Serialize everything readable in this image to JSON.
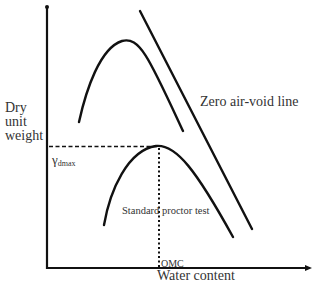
{
  "diagram": {
    "y_axis_label": [
      "Dry",
      "unit",
      "weight"
    ],
    "x_axis_label": "Water content",
    "y_marker": {
      "symbol": "γ",
      "subscript": "dmax"
    },
    "x_marker": "OMC",
    "curves": [
      {
        "name": "upper-compaction-curve",
        "label": ""
      },
      {
        "name": "standard-proctor-curve",
        "label": "Standard proctor test"
      },
      {
        "name": "zero-air-void-line",
        "label": "Zero air-void line"
      }
    ],
    "colors": {
      "line": "#111111",
      "text": "#333333",
      "background": "#ffffff"
    }
  }
}
